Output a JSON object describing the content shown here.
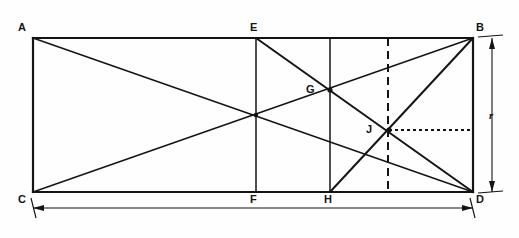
{
  "figure": {
    "background_color": "#fefefe",
    "stroke_color": "#141414"
  },
  "rectangle": {
    "name": "ABDC",
    "left": 33,
    "top": 38,
    "right": 473,
    "bottom": 192,
    "width": 440,
    "height": 154
  },
  "points": [
    {
      "id": "A",
      "label": "A",
      "x": 33,
      "y": 38,
      "label_x": 18,
      "label_y": 22,
      "marked": false
    },
    {
      "id": "B",
      "label": "B",
      "x": 473,
      "y": 38,
      "label_x": 476,
      "label_y": 22,
      "marked": false
    },
    {
      "id": "C",
      "label": "C",
      "x": 33,
      "y": 192,
      "label_x": 18,
      "label_y": 194,
      "marked": false
    },
    {
      "id": "D",
      "label": "D",
      "x": 473,
      "y": 192,
      "label_x": 476,
      "label_y": 194,
      "marked": false
    },
    {
      "id": "E",
      "label": "E",
      "x": 256,
      "y": 38,
      "label_x": 250,
      "label_y": 22,
      "marked": false
    },
    {
      "id": "F",
      "label": "F",
      "x": 256,
      "y": 192,
      "label_x": 250,
      "label_y": 194,
      "marked": false
    },
    {
      "id": "G",
      "label": "G",
      "x": 330,
      "y": 90,
      "label_x": 306,
      "label_y": 84,
      "marked": true
    },
    {
      "id": "H",
      "label": "H",
      "x": 330,
      "y": 192,
      "label_x": 324,
      "label_y": 194,
      "marked": false
    },
    {
      "id": "J",
      "label": "J",
      "x": 389,
      "y": 130,
      "label_x": 366,
      "label_y": 124,
      "marked": true
    }
  ],
  "segments": {
    "border": [
      {
        "name": "side-AB",
        "x1": 33,
        "y1": 38,
        "x2": 473,
        "y2": 38
      },
      {
        "name": "side-BD",
        "x1": 473,
        "y1": 38,
        "x2": 473,
        "y2": 192
      },
      {
        "name": "side-DC",
        "x1": 473,
        "y1": 192,
        "x2": 33,
        "y2": 192
      },
      {
        "name": "side-CA",
        "x1": 33,
        "y1": 192,
        "x2": 33,
        "y2": 38
      }
    ],
    "diagonals": [
      {
        "name": "diagonal-AD",
        "x1": 33,
        "y1": 38,
        "x2": 473,
        "y2": 192
      },
      {
        "name": "diagonal-CB",
        "x1": 33,
        "y1": 192,
        "x2": 473,
        "y2": 38
      }
    ],
    "verticals": [
      {
        "name": "vertical-EF",
        "x1": 256,
        "y1": 38,
        "x2": 256,
        "y2": 192
      },
      {
        "name": "vertical-GH",
        "x1": 330,
        "y1": 38,
        "x2": 330,
        "y2": 192
      }
    ],
    "construction": [
      {
        "name": "line-ED",
        "x1": 256,
        "y1": 38,
        "x2": 473,
        "y2": 192
      },
      {
        "name": "line-HB",
        "x1": 330,
        "y1": 192,
        "x2": 473,
        "y2": 38
      }
    ],
    "dashed": [
      {
        "name": "dashed-vertical-through-J",
        "x1": 388,
        "y1": 38,
        "x2": 388,
        "y2": 192
      }
    ],
    "dotted": [
      {
        "name": "dotted-horizontal-from-J",
        "x1": 389,
        "y1": 130,
        "x2": 473,
        "y2": 130
      }
    ]
  },
  "dimensions": {
    "width_dim": {
      "name": "overall-width-dimension",
      "x1": 31,
      "x2": 473,
      "y": 208,
      "ext_top": 192,
      "label": ""
    },
    "height_dim": {
      "name": "height-dimension-r",
      "x": 492,
      "y1": 38,
      "y2": 192,
      "ext_left": 473,
      "label": "r",
      "label_x": 489,
      "label_y": 110
    }
  }
}
